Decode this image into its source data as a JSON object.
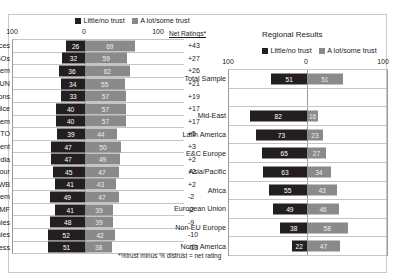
{
  "page": {
    "faint_header": "",
    "footnote": "*%trust minus % distrust = net rating"
  },
  "legend": {
    "dark_label": "Little/no trust",
    "grey_label": "A lot/some trust",
    "dark_color": "#231f20",
    "grey_color": "#8a8a8a"
  },
  "left_chart": {
    "axis_labels": [
      "100",
      "0",
      "100"
    ],
    "net_header": "Net Ratings*"
  },
  "right_chart": {
    "title": "Regional Results",
    "axis_labels": [
      "100",
      "0",
      "100"
    ]
  },
  "chart_data": [
    {
      "type": "bar",
      "title": "",
      "subtitle": "",
      "orientation": "horizontal-diverging",
      "xlabel": "",
      "ylabel": "",
      "xlim": [
        -100,
        100
      ],
      "grid": true,
      "legend": [
        "Little/no trust",
        "A lot/some trust"
      ],
      "legend_position": "top",
      "axis_ticks": [
        "100",
        "0",
        "100"
      ],
      "extra_column_header": "Net Ratings*",
      "categories": [
        "Armed forces",
        "NGOs",
        "Education system",
        "UN",
        "Religious institutions",
        "Police",
        "Health system",
        "WTO",
        "Government",
        "Press/media",
        "Trade unions/labour",
        "WB",
        "Legal system",
        "IMF",
        "Global companies",
        "Large national companies",
        "Parliament/Congress"
      ],
      "series": [
        {
          "name": "Little/no trust",
          "values": [
            26,
            32,
            36,
            34,
            33,
            40,
            40,
            39,
            47,
            47,
            45,
            41,
            49,
            41,
            48,
            52,
            51
          ]
        },
        {
          "name": "A lot/some trust",
          "values": [
            69,
            59,
            62,
            55,
            57,
            57,
            57,
            44,
            50,
            49,
            47,
            43,
            47,
            39,
            39,
            42,
            38
          ]
        }
      ],
      "net_ratings": [
        "+43",
        "+27",
        "+26",
        "+21",
        "+19",
        "+17",
        "+17",
        "+5",
        "+3",
        "+2",
        "+2",
        "+2",
        "-2",
        "-2",
        "-9",
        "-10",
        "-13"
      ]
    },
    {
      "type": "bar",
      "title": "Regional Results",
      "orientation": "horizontal-diverging",
      "xlabel": "",
      "ylabel": "",
      "xlim": [
        -100,
        100
      ],
      "grid": true,
      "legend": [
        "Little/no trust",
        "A lot/some trust"
      ],
      "legend_position": "top",
      "axis_ticks": [
        "100",
        "0",
        "100"
      ],
      "categories": [
        "Total Sample",
        "",
        "Mid-East",
        "Latin America",
        "E&C Europe",
        "Asia/Pacific",
        "Africa",
        "European Union",
        "Non-EU Europe",
        "North America"
      ],
      "series": [
        {
          "name": "Little/no trust",
          "values": [
            51,
            null,
            82,
            73,
            65,
            63,
            55,
            49,
            38,
            22
          ]
        },
        {
          "name": "A lot/some trust",
          "values": [
            51,
            null,
            16,
            23,
            27,
            34,
            43,
            46,
            58,
            47
          ]
        }
      ]
    }
  ]
}
